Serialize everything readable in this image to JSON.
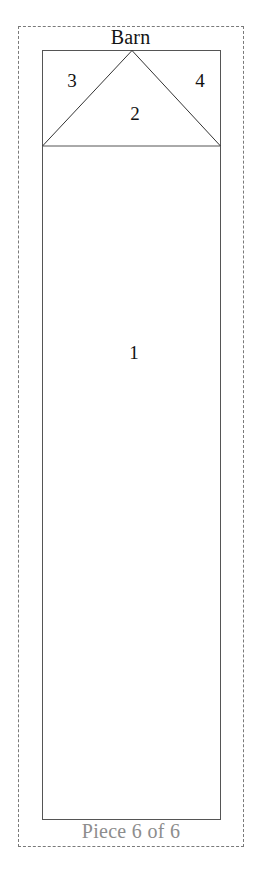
{
  "figure": {
    "title": "Barn",
    "caption": "Piece 6 of 6",
    "stroke_color": "#555555",
    "dash_color": "#7a7a7a",
    "label_color": "#111111",
    "caption_color": "#8d8d8d",
    "background_color": "#ffffff"
  },
  "bounds": {
    "dashed_box": {
      "x": 18,
      "y": 26,
      "width": 226,
      "height": 821
    },
    "body_rect": {
      "x": 42,
      "y": 50,
      "width": 179,
      "height": 770
    },
    "roof_line_y": 146
  },
  "parts": [
    {
      "id": "1",
      "label": "1",
      "name": "barn-body-panel",
      "x": 134,
      "y": 352
    },
    {
      "id": "2",
      "label": "2",
      "name": "roof-gable-triangle",
      "x": 135,
      "y": 113
    },
    {
      "id": "3",
      "label": "3",
      "name": "roof-left-corner",
      "x": 72,
      "y": 80
    },
    {
      "id": "4",
      "label": "4",
      "name": "roof-right-corner",
      "x": 200,
      "y": 80
    }
  ]
}
